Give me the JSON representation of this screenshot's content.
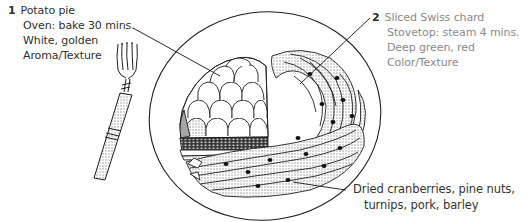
{
  "figure": {
    "elements": [
      "fork",
      "plate",
      "potato-pie",
      "swiss-chard",
      "grain-salad"
    ]
  },
  "annotations": [
    {
      "number": "1",
      "lines": [
        "Potato pie",
        "Oven: bake 30 mins.",
        "White, golden",
        "Aroma/Texture"
      ]
    },
    {
      "number": "2",
      "lines": [
        "Sliced Swiss chard",
        "Stovetop: steam 4 mins.",
        "Deep green, red",
        "Color/Texture"
      ]
    },
    {
      "number": "",
      "lines": [
        "Dried cranberries, pine nuts,",
        "turnips, pork, barley"
      ]
    }
  ],
  "colors": {
    "ink": "#1e1e1e",
    "label_dark": "#2f2f2f",
    "label_light": "#8a8a8a",
    "shade": "#cfcfcf",
    "paper": "#ffffff"
  }
}
